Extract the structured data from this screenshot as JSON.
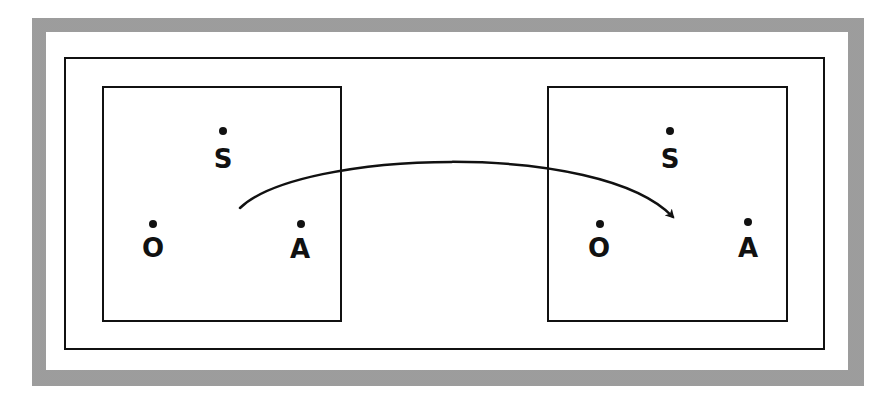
{
  "diagram": {
    "type": "two-world transformation diagram",
    "colors": {
      "stroke": "#111111",
      "frame_band": "#cfcfcf",
      "background": "#ffffff"
    },
    "worlds": [
      {
        "id": "left",
        "points": [
          {
            "label": "S",
            "dot": {
              "x": 223,
              "y": 131
            },
            "text": {
              "x": 223,
              "y": 146
            }
          },
          {
            "label": "O",
            "dot": {
              "x": 153,
              "y": 224
            },
            "text": {
              "x": 153,
              "y": 235
            }
          },
          {
            "label": "A",
            "dot": {
              "x": 301,
              "y": 224
            },
            "text": {
              "x": 300,
              "y": 236
            }
          }
        ]
      },
      {
        "id": "right",
        "points": [
          {
            "label": "S",
            "dot": {
              "x": 670,
              "y": 131
            },
            "text": {
              "x": 670,
              "y": 146
            }
          },
          {
            "label": "O",
            "dot": {
              "x": 600,
              "y": 224
            },
            "text": {
              "x": 599,
              "y": 235
            }
          },
          {
            "label": "A",
            "dot": {
              "x": 748,
              "y": 222
            },
            "text": {
              "x": 748,
              "y": 235
            }
          }
        ]
      }
    ],
    "arrow": {
      "from_world": "left",
      "to_world": "right",
      "path": "M 240 208 C 300 150, 600 140, 673 217"
    }
  }
}
